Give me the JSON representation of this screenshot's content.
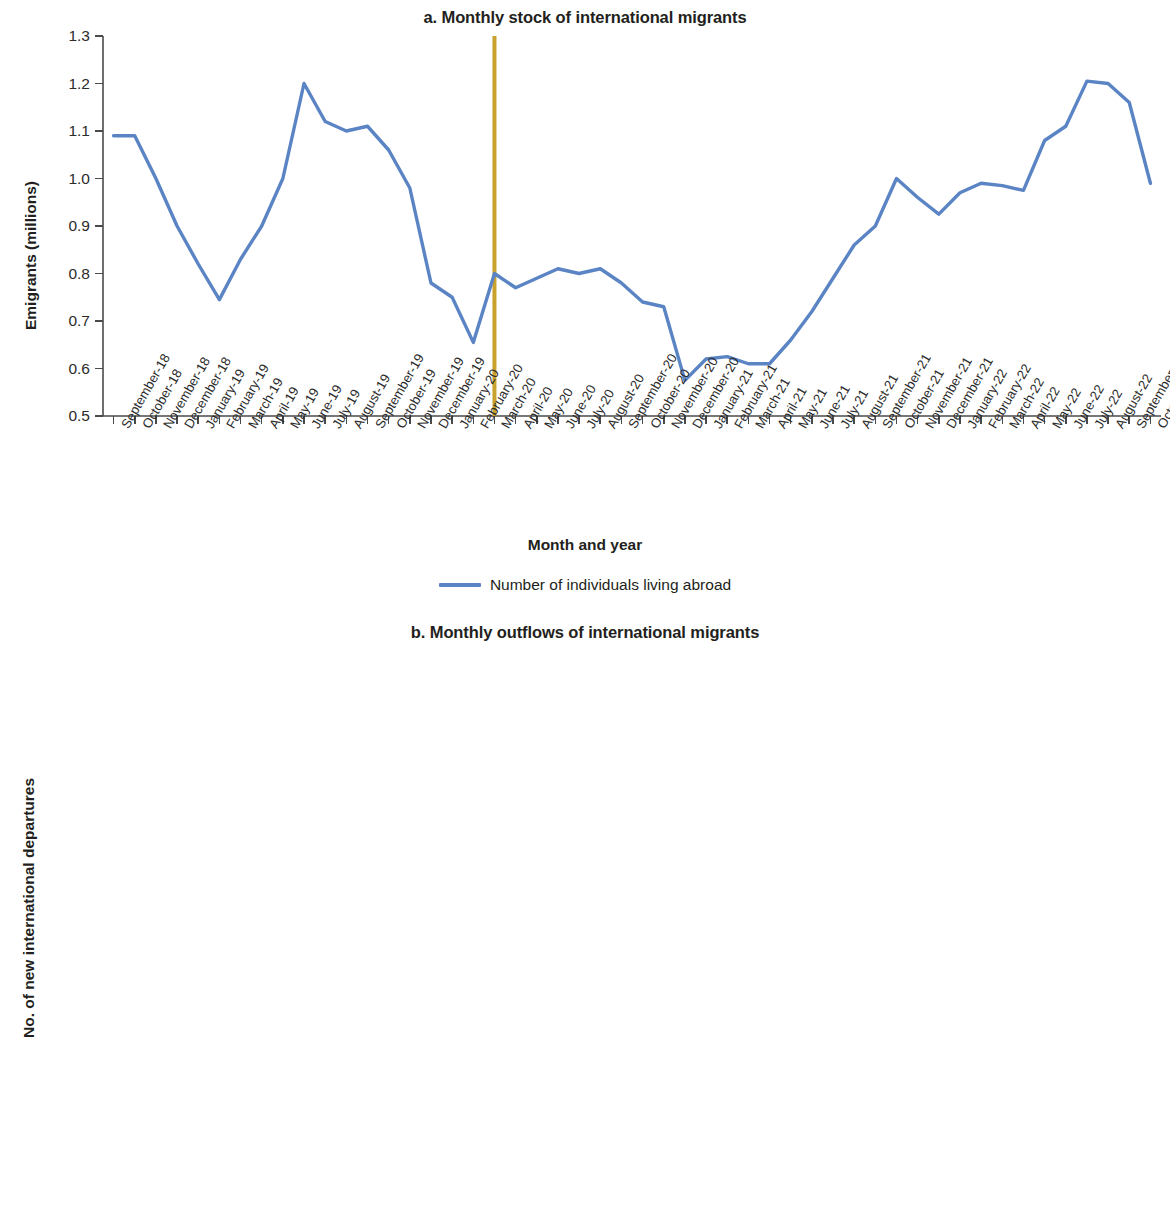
{
  "colors": {
    "stock_line": "#5b84c4",
    "raw_line": "#c0544a",
    "moving_avg_line": "#7cae7f",
    "reference_line": "#c8a22c",
    "axis": "#4a4a4a",
    "text": "#231f20"
  },
  "panel_a": {
    "title": "a. Monthly stock of international migrants",
    "ylabel": "Emigrants (millions)",
    "xlabel": "Month and year",
    "yticks": [
      "0.5",
      "0.6",
      "0.7",
      "0.8",
      "0.9",
      "1.0",
      "1.1",
      "1.2",
      "1.3"
    ],
    "legend": [
      {
        "label": "Number of individuals living abroad",
        "color": "#5b84c4"
      }
    ]
  },
  "panel_b": {
    "title": "b. Monthly outflows of international migrants",
    "ylabel": "No. of new international departures",
    "xlabel": "Month and year",
    "yticks": [
      "0",
      "50,0000",
      "100,000",
      "150,000",
      "200,000",
      "250,000",
      "300,000",
      "350,000",
      "400,000"
    ],
    "legend": [
      {
        "label": "New departures (raw statistics)",
        "color": "#c0544a"
      },
      {
        "label": "New departures (3-month moving average)",
        "color": "#7cae7f"
      }
    ]
  },
  "chart_data": [
    {
      "type": "line",
      "id": "panel-a",
      "title": "a. Monthly stock of international migrants",
      "xlabel": "Month and year",
      "ylabel": "Emigrants (millions)",
      "ylim": [
        0.5,
        1.3
      ],
      "ytick_values": [
        0.5,
        0.6,
        0.7,
        0.8,
        0.9,
        1.0,
        1.1,
        1.2,
        1.3
      ],
      "grid": false,
      "legend_position": "bottom",
      "annotations": [
        {
          "kind": "vertical-reference-line",
          "at": "March-20",
          "color": "#c8a22c"
        }
      ],
      "categories": [
        "September-18",
        "October-18",
        "November-18",
        "December-18",
        "January-19",
        "February-19",
        "March-19",
        "April-19",
        "May-19",
        "June-19",
        "July-19",
        "August-19",
        "September-19",
        "October-19",
        "November-19",
        "December-19",
        "January-20",
        "February-20",
        "March-20",
        "April-20",
        "May-20",
        "June-20",
        "July-20",
        "August-20",
        "September-20",
        "October-20",
        "November-20",
        "December-20",
        "January-21",
        "February-21",
        "March-21",
        "April-21",
        "May-21",
        "June-21",
        "July-21",
        "August-21",
        "September-21",
        "October-21",
        "November-21",
        "December-21",
        "January-22",
        "February-22",
        "March-22",
        "April-22",
        "May-22",
        "June-22",
        "July-22",
        "August-22",
        "September-22",
        "October-22"
      ],
      "series": [
        {
          "name": "Number of individuals living abroad",
          "color": "#5b84c4",
          "values": [
            1.09,
            1.09,
            1.0,
            0.9,
            0.82,
            0.745,
            0.83,
            0.9,
            1.0,
            1.2,
            1.12,
            1.1,
            1.11,
            1.06,
            0.98,
            0.78,
            0.75,
            0.655,
            0.8,
            0.77,
            0.79,
            0.81,
            0.8,
            0.81,
            0.78,
            0.74,
            0.73,
            0.575,
            0.62,
            0.625,
            0.61,
            0.61,
            0.66,
            0.72,
            0.79,
            0.86,
            0.9,
            1.0,
            0.96,
            0.925,
            0.97,
            0.99,
            0.985,
            0.975,
            1.08,
            1.11,
            1.205,
            1.2,
            1.16,
            0.99
          ]
        }
      ]
    },
    {
      "type": "line",
      "id": "panel-b",
      "title": "b. Monthly outflows of international migrants",
      "xlabel": "Month and year",
      "ylabel": "No. of new international departures",
      "ylim": [
        0,
        400000
      ],
      "ytick_values": [
        0,
        50000,
        100000,
        150000,
        200000,
        250000,
        300000,
        350000,
        400000
      ],
      "grid": false,
      "legend_position": "bottom",
      "annotations": [
        {
          "kind": "vertical-reference-line",
          "at": "April-20",
          "color": "#c8a22c"
        }
      ],
      "categories": [
        "October-18",
        "November-18",
        "December-18",
        "January-19",
        "February-19",
        "March-19",
        "April-19",
        "May-19",
        "June-19",
        "July-19",
        "August-19",
        "September-19",
        "October-19",
        "November-19",
        "December-19",
        "January-20",
        "February-20",
        "March-20",
        "April-20",
        "May-20",
        "June-20",
        "July-20",
        "August-20",
        "September-20",
        "October-20",
        "November-20",
        "December-20",
        "January-21",
        "February-21",
        "March-21",
        "April-21",
        "May-21",
        "June-21",
        "July-21",
        "August-21",
        "September-21",
        "October-21",
        "November-21",
        "December-21",
        "January-22",
        "February-22",
        "March-22",
        "April-22",
        "May-22",
        "June-22",
        "July-22",
        "August-22",
        "September-22",
        "October-22"
      ],
      "series": [
        {
          "name": "New departures (raw statistics)",
          "color": "#c0544a",
          "values": [
            278000,
            200000,
            148000,
            138000,
            225000,
            255000,
            250000,
            360000,
            222000,
            228000,
            195000,
            145000,
            202000,
            100000,
            157000,
            150000,
            102000,
            182000,
            193000,
            133000,
            95000,
            78000,
            58000,
            83000,
            62000,
            48000,
            70000,
            35000,
            122000,
            85000,
            68000,
            95000,
            120000,
            161000,
            125000,
            170000,
            162000,
            185000,
            152000,
            130000,
            176000,
            103000,
            160000,
            234000,
            155000,
            253000,
            177000,
            212000,
            121000
          ]
        },
        {
          "name": "New departures (3-month moving average)",
          "color": "#7cae7f",
          "values": [
            189000,
            192000,
            199000,
            212000,
            223000,
            231000,
            240000,
            245000,
            230000,
            222000,
            212000,
            188000,
            166000,
            155000,
            153000,
            152000,
            142000,
            139000,
            128000,
            112000,
            108000,
            94000,
            79000,
            70000,
            71000,
            69000,
            70000,
            72000,
            76000,
            90000,
            104000,
            118000,
            131000,
            143000,
            150000,
            152000,
            158000,
            157000,
            155000,
            148000,
            150000,
            156000,
            171000,
            176000,
            179000,
            197000,
            190000,
            187000,
            177000
          ]
        }
      ]
    }
  ]
}
